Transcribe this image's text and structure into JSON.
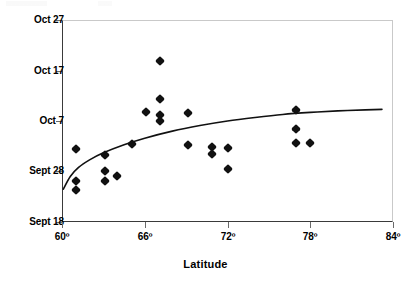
{
  "chart_data": {
    "type": "scatter",
    "title": "",
    "xlabel": "Latitude",
    "ylabel": "",
    "xlim": [
      60,
      84
    ],
    "ylim": [
      0,
      40
    ],
    "grid": false,
    "legend": null,
    "x_tick_labels": [
      "60º",
      "66º",
      "72º",
      "78º",
      "84º"
    ],
    "x_tick_values": [
      60,
      66,
      72,
      78,
      84
    ],
    "y_tick_labels": [
      "Sept 18",
      "Sept 28",
      "Oct 7",
      "Oct 17",
      "Oct 27"
    ],
    "y_tick_values": [
      0,
      10,
      20,
      30,
      40
    ],
    "y_axis_note": "Dates: Sept 18 = 0 days, each tick = 10 days",
    "series": [
      {
        "name": "observations",
        "marker": "diamond",
        "color": "#111111",
        "points": [
          {
            "x": 61.0,
            "y": 6.3
          },
          {
            "x": 61.0,
            "y": 8.1
          },
          {
            "x": 61.0,
            "y": 14.5
          },
          {
            "x": 63.1,
            "y": 8.2
          },
          {
            "x": 63.1,
            "y": 10.1
          },
          {
            "x": 63.1,
            "y": 13.3
          },
          {
            "x": 64.0,
            "y": 9.2
          },
          {
            "x": 65.1,
            "y": 15.4
          },
          {
            "x": 66.1,
            "y": 21.8
          },
          {
            "x": 67.1,
            "y": 21.2
          },
          {
            "x": 67.1,
            "y": 20.0
          },
          {
            "x": 67.1,
            "y": 31.9
          },
          {
            "x": 67.1,
            "y": 24.4
          },
          {
            "x": 69.1,
            "y": 21.6
          },
          {
            "x": 69.1,
            "y": 15.2
          },
          {
            "x": 70.9,
            "y": 14.9
          },
          {
            "x": 70.9,
            "y": 13.5
          },
          {
            "x": 72.0,
            "y": 14.7
          },
          {
            "x": 72.0,
            "y": 10.5
          },
          {
            "x": 77.0,
            "y": 22.2
          },
          {
            "x": 77.0,
            "y": 18.4
          },
          {
            "x": 77.0,
            "y": 15.6
          },
          {
            "x": 78.0,
            "y": 15.6
          }
        ]
      }
    ],
    "trend_curve": {
      "name": "logarithmic fit",
      "color": "#111111",
      "shape": "logarithmic rising, flattening toward right",
      "points": [
        {
          "x": 60.1,
          "y": 6.5
        },
        {
          "x": 60.6,
          "y": 9.0
        },
        {
          "x": 61.2,
          "y": 10.8
        },
        {
          "x": 62.0,
          "y": 12.3
        },
        {
          "x": 63.0,
          "y": 13.7
        },
        {
          "x": 64.5,
          "y": 15.3
        },
        {
          "x": 66.0,
          "y": 16.6
        },
        {
          "x": 68.0,
          "y": 18.0
        },
        {
          "x": 70.0,
          "y": 19.1
        },
        {
          "x": 72.0,
          "y": 20.0
        },
        {
          "x": 74.0,
          "y": 20.7
        },
        {
          "x": 76.0,
          "y": 21.3
        },
        {
          "x": 78.0,
          "y": 21.7
        },
        {
          "x": 80.0,
          "y": 22.0
        },
        {
          "x": 82.0,
          "y": 22.2
        },
        {
          "x": 83.2,
          "y": 22.3
        }
      ]
    }
  },
  "axis": {
    "x_title": "Latitude",
    "x_ticks": [
      {
        "label": "60º",
        "px": 62
      },
      {
        "label": "66º",
        "px": 145
      },
      {
        "label": "72º",
        "px": 228
      },
      {
        "label": "78º",
        "px": 310
      },
      {
        "label": "84º",
        "px": 393
      }
    ],
    "y_ticks": [
      {
        "label": "Oct 27",
        "px": 20
      },
      {
        "label": "Oct 17",
        "px": 71
      },
      {
        "label": "Oct 7",
        "px": 121
      },
      {
        "label": "Sept 28",
        "px": 171
      },
      {
        "label": "Sept 18",
        "px": 222
      }
    ]
  }
}
